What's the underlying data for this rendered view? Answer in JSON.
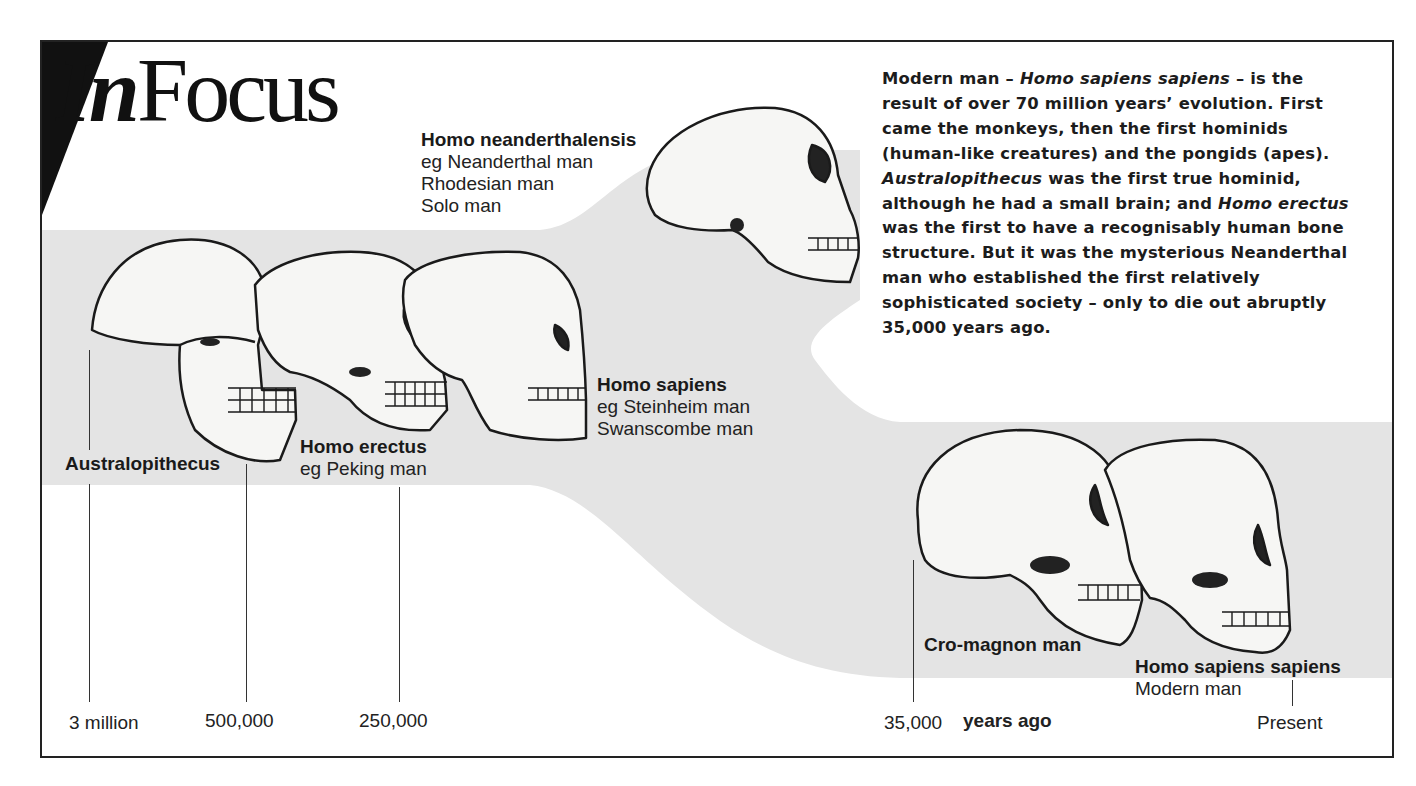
{
  "header": {
    "logo_in": "In",
    "logo_focus": "Focus"
  },
  "intro": {
    "segments": [
      {
        "text": "Modern man – ",
        "italic": false
      },
      {
        "text": "Homo sapiens sapiens",
        "italic": true
      },
      {
        "text": " – is the result of over 70 million years’ evolution. First came the monkeys, then the first hominids (human-like creatures) and the pongids (apes). ",
        "italic": false
      },
      {
        "text": "Australopithecus",
        "italic": true
      },
      {
        "text": " was the first true hominid, although he had a small brain; and ",
        "italic": false
      },
      {
        "text": "Homo erectus",
        "italic": true
      },
      {
        "text": " was the first to have a recognisably human bone structure. But it was the mysterious Neanderthal man who established the first relatively sophisticated society – only to die out abruptly 35,000 years ago.",
        "italic": false
      }
    ],
    "line_1": "Modern man –",
    "line_1_italic": "Homo sapiens sapiens",
    "line_1_end": "– is the",
    "line_2": "result of over 70 million years’ evolution. First",
    "line_3": "came the monkeys, then the first hominids",
    "line_4": "(human-like creatures) and the pongids (apes).",
    "line_5_italic": "Australopithecus",
    "line_5_end": "was the first true hominid,",
    "line_6": "although he had a small brain; and",
    "line_6_italic": "Homo erectus",
    "line_7": "was the first to have a recognisably human bone",
    "line_8": "structure. But it was the mysterious Neanderthal",
    "line_9": "man who established the first relatively",
    "line_10": "sophisticated society – only to die out abruptly",
    "line_11": "35,000 years ago."
  },
  "species": {
    "neanderthalensis": {
      "name": "Homo neanderthalensis",
      "examples": [
        "eg Neanderthal man",
        "Rhodesian man",
        "Solo man"
      ]
    },
    "australopithecus": {
      "name": "Australopithecus"
    },
    "erectus": {
      "name": "Homo erectus",
      "examples": [
        "eg Peking man"
      ]
    },
    "sapiens": {
      "name": "Homo sapiens",
      "examples": [
        "eg Steinheim man",
        "Swanscombe man"
      ]
    },
    "cromagnon": {
      "name": "Cro-magnon man"
    },
    "sapiens_sapiens": {
      "name": "Homo sapiens sapiens",
      "examples": [
        "Modern man"
      ]
    }
  },
  "timeline": {
    "unit_label": "years ago",
    "ticks": [
      {
        "label": "3 million",
        "x": 89
      },
      {
        "label": "500,000",
        "x": 246
      },
      {
        "label": "250,000",
        "x": 399
      },
      {
        "label": "35,000",
        "x": 913
      },
      {
        "label": "Present",
        "x": 1292
      }
    ]
  },
  "colors": {
    "band": "#e4e4e4",
    "ink": "#1a1a1a",
    "paper": "#ffffff"
  }
}
